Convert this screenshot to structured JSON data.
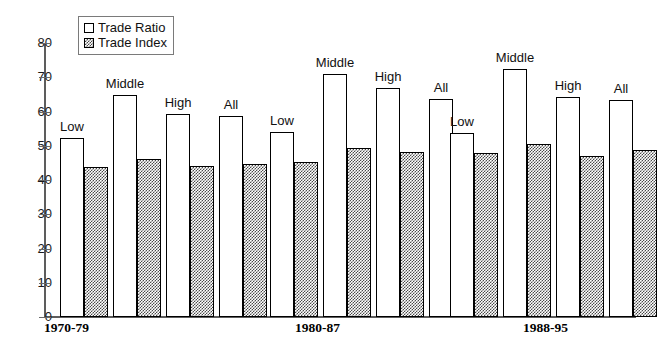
{
  "chart_data": {
    "type": "bar",
    "title": "",
    "xlabel": "",
    "ylabel": "",
    "ylim": [
      0,
      80
    ],
    "ytick_step": 10,
    "yticks": [
      "80",
      "70",
      "60",
      "50",
      "40",
      "30",
      "20",
      "10",
      "0"
    ],
    "grid": false,
    "legend_position": "top-left",
    "legend": [
      "Trade Ratio",
      "Trade Index"
    ],
    "categories": [
      "Low",
      "Middle",
      "High",
      "All"
    ],
    "groups": [
      "1970-79",
      "1980-87",
      "1988-95"
    ],
    "series": [
      {
        "name": "Trade Ratio",
        "fill": "white",
        "values_by_group": {
          "1970-79": [
            52.2,
            64.8,
            59.4,
            58.8
          ],
          "1980-87": [
            54.1,
            71.0,
            66.8,
            63.6
          ],
          "1988-95": [
            53.6,
            72.3,
            64.2,
            63.4
          ]
        }
      },
      {
        "name": "Trade Index",
        "fill": "hatched-gray",
        "values_by_group": {
          "1970-79": [
            43.8,
            46.1,
            44.2,
            44.7
          ],
          "1980-87": [
            45.4,
            49.4,
            48.2,
            47.5
          ],
          "1988-95": [
            47.8,
            50.5,
            46.9,
            48.9
          ]
        }
      }
    ],
    "annotations": [
      {
        "group": "1970-79",
        "category": "Low",
        "text": "Low"
      },
      {
        "group": "1970-79",
        "category": "Middle",
        "text": "Middle"
      },
      {
        "group": "1970-79",
        "category": "High",
        "text": "High"
      },
      {
        "group": "1970-79",
        "category": "All",
        "text": "All"
      },
      {
        "group": "1980-87",
        "category": "Low",
        "text": "Low"
      },
      {
        "group": "1980-87",
        "category": "Middle",
        "text": "Middle"
      },
      {
        "group": "1980-87",
        "category": "High",
        "text": "High"
      },
      {
        "group": "1980-87",
        "category": "All",
        "text": "All"
      },
      {
        "group": "1988-95",
        "category": "Low",
        "text": "Low"
      },
      {
        "group": "1988-95",
        "category": "Middle",
        "text": "Middle"
      },
      {
        "group": "1988-95",
        "category": "High",
        "text": "High"
      },
      {
        "group": "1988-95",
        "category": "All",
        "text": "All"
      }
    ],
    "colors": {
      "ratio_fill": "#ffffff",
      "index_fill": "#4a4a4a",
      "bar_outline": "#000000",
      "axis": "#5d5d5d",
      "text": "#111111"
    }
  },
  "axis": {
    "y_labels": [
      "80",
      "70",
      "60",
      "50",
      "40",
      "30",
      "20",
      "10",
      "0"
    ],
    "group_labels": [
      "1970-79",
      "1980-87",
      "1988-95"
    ]
  },
  "legend": {
    "items": [
      {
        "label": "Trade Ratio",
        "swatch": "white-square-icon"
      },
      {
        "label": "Trade Index",
        "swatch": "hatched-square-icon"
      }
    ]
  }
}
